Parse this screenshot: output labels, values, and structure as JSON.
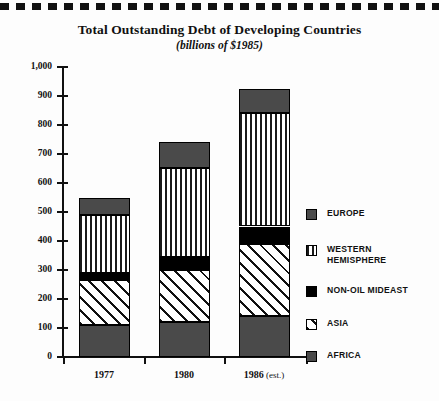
{
  "chart_data": {
    "type": "bar",
    "subtype": "stacked-bar",
    "title": "Total Outstanding Debt of Developing Countries",
    "subtitle": "(billions of $1985)",
    "xlabel": "",
    "ylabel": "",
    "categories": [
      "1977",
      "1980",
      "1986 (est.)"
    ],
    "category_labels_main": [
      "1977",
      "1980",
      "1986"
    ],
    "category_label_suffix": [
      "",
      "",
      "(est.)"
    ],
    "ylim": [
      0,
      1000
    ],
    "ytick_values": [
      0,
      100,
      200,
      300,
      400,
      500,
      600,
      700,
      800,
      900,
      1000
    ],
    "ytick_labels": [
      "0",
      "100",
      "200",
      "300",
      "400",
      "500",
      "600",
      "700",
      "800",
      "900",
      "1,000"
    ],
    "grid": false,
    "legend_position": "right",
    "stack_order_bottom_to_top": [
      "AFRICA",
      "ASIA",
      "NON-OIL MIDEAST",
      "WESTERN HEMISPHERE",
      "EUROPE"
    ],
    "series": [
      {
        "name": "AFRICA",
        "pattern": "solid-dark-gray",
        "values": [
          110,
          120,
          140
        ]
      },
      {
        "name": "ASIA",
        "pattern": "diagonal-hatch",
        "values": [
          155,
          180,
          250
        ]
      },
      {
        "name": "NON-OIL MIDEAST",
        "pattern": "solid-black",
        "values": [
          25,
          45,
          60
        ]
      },
      {
        "name": "WESTERN HEMISPHERE",
        "pattern": "vertical-stripes",
        "values": [
          200,
          305,
          390
        ]
      },
      {
        "name": "EUROPE",
        "pattern": "solid-dark-gray",
        "values": [
          60,
          90,
          85
        ]
      }
    ],
    "cumulative_tops": [
      {
        "category": "1977",
        "boundaries": [
          0,
          110,
          265,
          290,
          490,
          550
        ],
        "total": 550
      },
      {
        "category": "1980",
        "boundaries": [
          0,
          120,
          300,
          345,
          650,
          740
        ],
        "total": 740
      },
      {
        "category": "1986 (est.)",
        "boundaries": [
          0,
          140,
          390,
          450,
          840,
          925
        ],
        "total": 925
      }
    ]
  },
  "legend": {
    "items": [
      {
        "label": "EUROPE",
        "swatch": "solid-dark-gray"
      },
      {
        "label": "WESTERN\nHEMISPHERE",
        "swatch": "vertical-stripes"
      },
      {
        "label": "NON-OIL MIDEAST",
        "swatch": "solid-black"
      },
      {
        "label": "ASIA",
        "swatch": "diagonal-hatch"
      },
      {
        "label": "AFRICA",
        "swatch": "solid-dark-gray"
      }
    ]
  },
  "colors": {
    "dark_gray": "#4a4a4a",
    "black": "#000000",
    "white": "#ffffff",
    "axis": "#111111"
  }
}
